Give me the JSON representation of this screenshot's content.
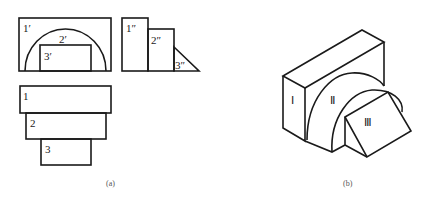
{
  "figure_a": {
    "caption": "(a)",
    "front_view": {
      "labels": [
        "1′",
        "2′",
        "3′"
      ]
    },
    "side_view": {
      "labels": [
        "1″",
        "2″",
        "3″"
      ]
    },
    "top_view": {
      "labels": [
        "1",
        "2",
        "3"
      ]
    }
  },
  "figure_b": {
    "caption": "(b)",
    "labels": [
      "Ⅰ",
      "Ⅱ",
      "Ⅲ"
    ]
  },
  "colors": {
    "line": "#1a1a1a",
    "caption": "#555555",
    "background": "#ffffff"
  }
}
